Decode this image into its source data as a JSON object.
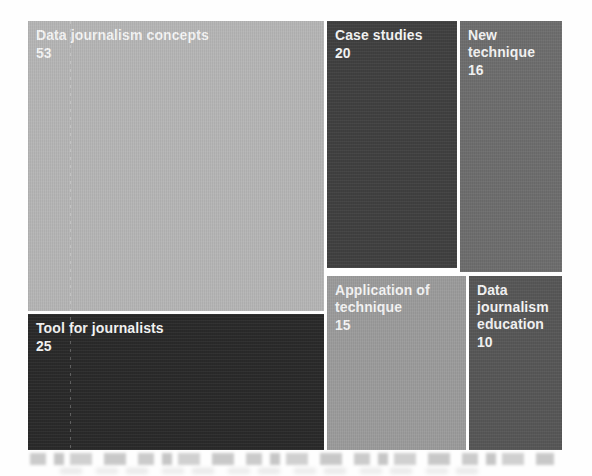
{
  "chart_data": {
    "type": "treemap",
    "text_color": "#f5f5f5",
    "nodes": [
      {
        "label": "Data journalism concepts",
        "value": 53,
        "color": "#b6b6b6"
      },
      {
        "label": "Tool for journalists",
        "value": 25,
        "color": "#2a2a2a"
      },
      {
        "label": "Case studies",
        "value": 20,
        "color": "#404040"
      },
      {
        "label": "New technique",
        "value": 16,
        "color": "#6e6e6e"
      },
      {
        "label": "Application of technique",
        "value": 15,
        "color": "#9c9c9c"
      },
      {
        "label": "Data journalism education",
        "value": 10,
        "color": "#575757"
      }
    ]
  }
}
